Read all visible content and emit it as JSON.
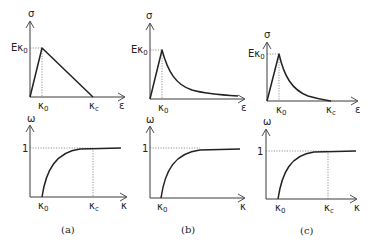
{
  "figure": {
    "panels": [
      {
        "caption": "(a)",
        "top": {
          "y_axis_label": "σ",
          "x_axis_label": "ε",
          "peak_label": "Eκ",
          "peak_sub": "0",
          "k0_label": "κ",
          "k0_sub": "0",
          "kc_label": "κ",
          "kc_sub": "c",
          "softening": "linear"
        },
        "bottom": {
          "y_axis_label": "ω",
          "x_axis_label": "κ",
          "one_label": "1",
          "k0_label": "κ",
          "k0_sub": "0",
          "kc_label": "κ",
          "kc_sub": "c"
        }
      },
      {
        "caption": "(b)",
        "top": {
          "y_axis_label": "σ",
          "x_axis_label": "ε",
          "peak_label": "Eκ",
          "peak_sub": "0",
          "k0_label": "κ",
          "k0_sub": "0",
          "softening": "exponential"
        },
        "bottom": {
          "y_axis_label": "ω",
          "x_axis_label": "κ",
          "one_label": "1",
          "k0_label": "κ",
          "k0_sub": "0"
        }
      },
      {
        "caption": "(c)",
        "top": {
          "y_axis_label": "σ",
          "x_axis_label": "ε",
          "peak_label": "Eκ",
          "peak_sub": "0",
          "k0_label": "κ",
          "k0_sub": "0",
          "kc_label": "κ",
          "kc_sub": "c",
          "softening": "exponential, truncated at κc"
        },
        "bottom": {
          "y_axis_label": "ω",
          "x_axis_label": "κ",
          "one_label": "1",
          "k0_label": "κ",
          "k0_sub": "0",
          "kc_label": "κ",
          "kc_sub": "c"
        }
      }
    ]
  }
}
